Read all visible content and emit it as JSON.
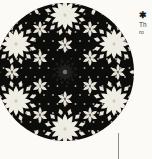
{
  "page": {
    "background_color": "#fbfaf7",
    "width": 152,
    "height": 159
  },
  "figure": {
    "name": "rose-window-geometric-pattern",
    "ink_color": "#0d0d0c",
    "tracery_color": "#efece4",
    "shape": "circle",
    "center": {
      "cx": 65,
      "cy": 72
    },
    "radius": 69,
    "rosette_count_ring": 6,
    "rosette_points": 12
  },
  "annotation": {
    "marker_glyph": "✱",
    "marker_name": "asterisk-star-marker",
    "caption_line_1": "Th",
    "caption_line_2": "ro"
  },
  "leader": {
    "name": "leader-line",
    "color": "#8e8d88"
  }
}
